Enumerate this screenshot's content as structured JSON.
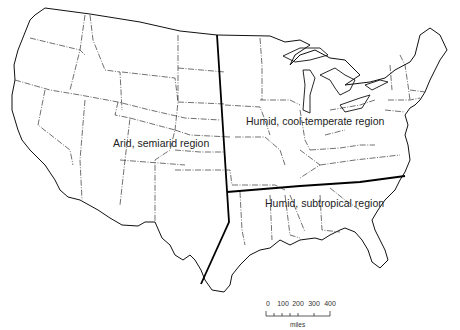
{
  "map": {
    "subject": "Conterminous United States climatic regions",
    "regions": [
      {
        "id": "arid",
        "label": "Arid, semiarid region"
      },
      {
        "id": "humid-cool",
        "label": "Humid, cool-temperate region"
      },
      {
        "id": "humid-subtropical",
        "label": "Humid, subtropical region"
      }
    ],
    "scale_bar": {
      "ticks": [
        "0",
        "100",
        "200",
        "300",
        "400"
      ],
      "unit": "miles"
    },
    "colors": {
      "outline": "#111111",
      "state_border": "#333333",
      "region_divider": "#000000",
      "background": "#ffffff"
    }
  }
}
